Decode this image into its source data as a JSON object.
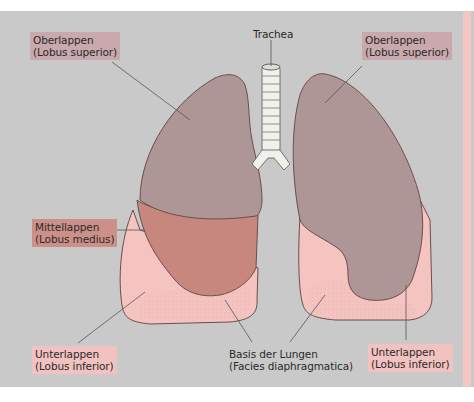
{
  "diagram": {
    "colors": {
      "background": "#c9c9c9",
      "upper_lobe": "#ae9596",
      "middle_lobe": "#c7877e",
      "lower_lobe": "#f5c4c0",
      "trachea": "#f2f0ea",
      "leader_line": "#555555",
      "label_upper_bg": "#c9a9ad",
      "label_middle_bg": "#cd9089",
      "label_lower_bg": "#f2c2c0"
    },
    "labels": {
      "trachea": {
        "line1": "Trachea"
      },
      "upper_left": {
        "line1": "Oberlappen",
        "line2": "(Lobus superior)"
      },
      "upper_right": {
        "line1": "Oberlappen",
        "line2": "(Lobus superior)"
      },
      "middle_left": {
        "line1": "Mittellappen",
        "line2": "(Lobus medius)"
      },
      "lower_left": {
        "line1": "Unterlappen",
        "line2": "(Lobus inferior)"
      },
      "base": {
        "line1": "Basis der Lungen",
        "line2": "(Facies diaphragmatica)"
      },
      "lower_right": {
        "line1": "Unterlappen",
        "line2": "(Lobus inferior)"
      }
    }
  }
}
